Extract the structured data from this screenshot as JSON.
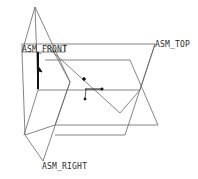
{
  "viewport": {
    "background": "#ffffff",
    "line_color": "#555555"
  },
  "datum_planes": [
    {
      "name": "ASM_FRONT",
      "label": "ASM_FRONT"
    },
    {
      "name": "ASM_TOP",
      "label": "ASM_TOP"
    },
    {
      "name": "ASM_RIGHT",
      "label": "ASM_RIGHT"
    }
  ]
}
